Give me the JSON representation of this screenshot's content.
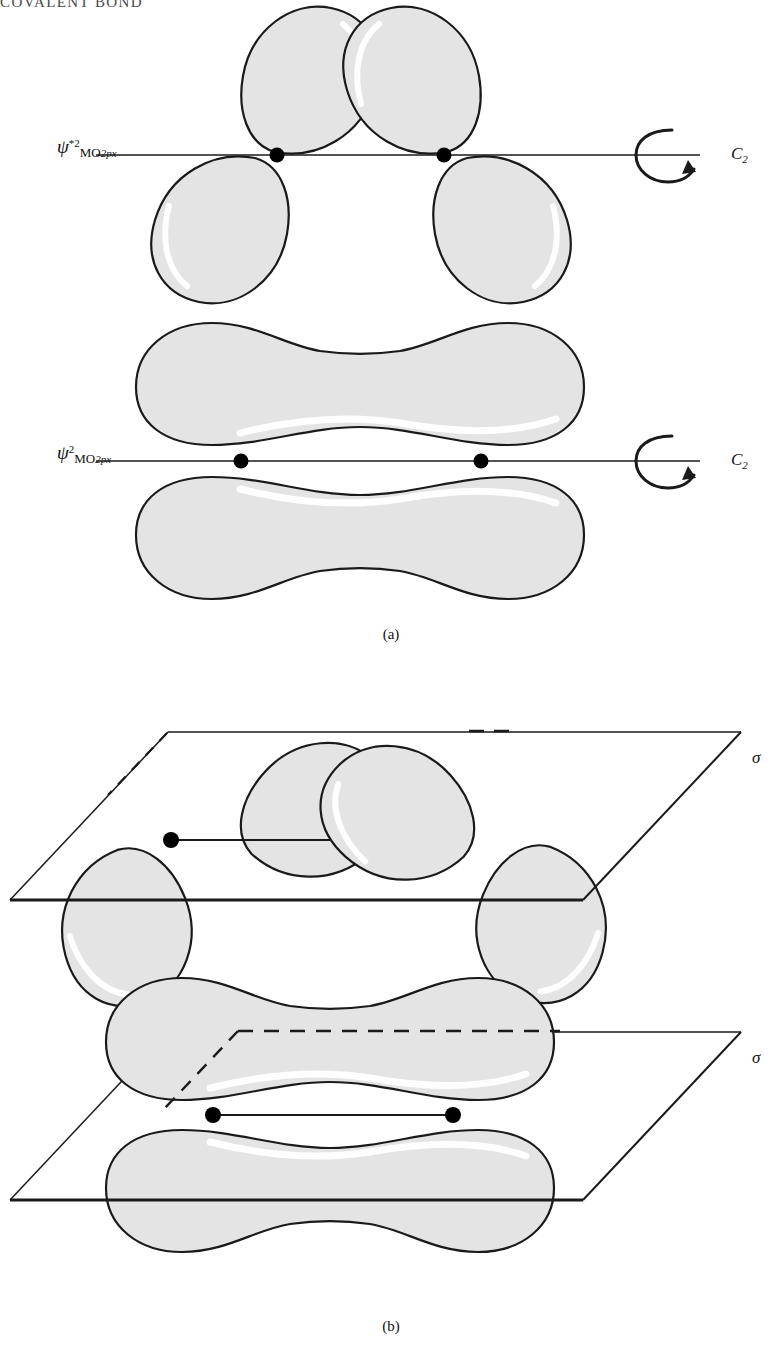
{
  "page": {
    "running_head": "COVALENT BOND",
    "background": "#ffffff",
    "width": 782,
    "height": 1351
  },
  "style": {
    "lobe_fill": "#e4e4e4",
    "lobe_stroke": "#1a1a1a",
    "highlight": "#ffffff",
    "axis_color": "#1a1a1a",
    "nucleus_color": "#000000",
    "plane_stroke": "#1a1a1a"
  },
  "figure": {
    "panels": [
      {
        "id": "a",
        "caption": "(a)",
        "symmetry_operation": "C2 rotation about the internuclear axis",
        "diagrams": [
          {
            "id": "antibonding-c2",
            "orbital_label": {
              "psi": "ψ",
              "superscript": "*2",
              "subscript_mo": "MO",
              "subscript_detail": "2px",
              "plain": "ψ*2 MO 2px"
            },
            "orbital_type": "antibonding",
            "lobe_count": 4,
            "nuclei": 2,
            "axis_symbol": {
              "name": "C",
              "subscript": "2",
              "glyph": "rotation-arrow"
            }
          },
          {
            "id": "bonding-c2",
            "orbital_label": {
              "psi": "ψ",
              "superscript": "2",
              "subscript_mo": "MO",
              "subscript_detail": "2px",
              "plain": "ψ2 MO 2px"
            },
            "orbital_type": "bonding",
            "lobe_count": 2,
            "nuclei": 2,
            "axis_symbol": {
              "name": "C",
              "subscript": "2",
              "glyph": "rotation-arrow"
            }
          }
        ]
      },
      {
        "id": "b",
        "caption": "(b)",
        "symmetry_operation": "sigma mirror plane containing the internuclear axis",
        "diagrams": [
          {
            "id": "antibonding-sigma",
            "orbital_type": "antibonding",
            "lobe_count": 4,
            "nuclei": 2,
            "plane_label": "σ"
          },
          {
            "id": "bonding-sigma",
            "orbital_type": "bonding",
            "lobe_count": 2,
            "nuclei": 2,
            "plane_label": "σ"
          }
        ]
      }
    ]
  }
}
